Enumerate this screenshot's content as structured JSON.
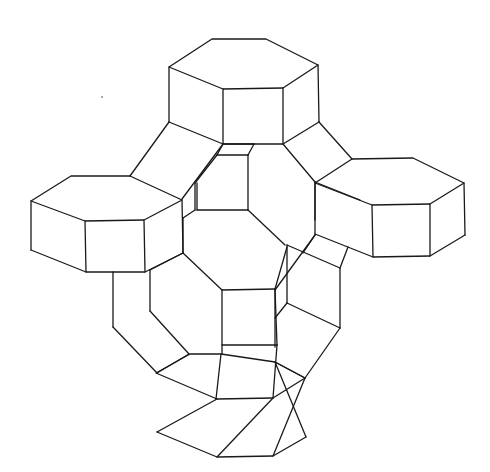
{
  "diagram": {
    "type": "line-drawing",
    "stroke_color": "#1a1a1a",
    "background": "#ffffff",
    "prisms": [
      {
        "name": "top-hexagonal-prism",
        "top": [
          [
            212,
            39
          ],
          [
            266,
            39
          ],
          [
            318,
            65
          ],
          [
            283,
            88
          ],
          [
            223,
            89
          ],
          [
            169,
            67
          ]
        ],
        "bottom_visible": [
          [
            169,
            122
          ],
          [
            223,
            144
          ],
          [
            283,
            144
          ],
          [
            319,
            122
          ]
        ]
      },
      {
        "name": "left-hexagonal-prism",
        "top": [
          [
            71,
            176
          ],
          [
            130,
            176
          ],
          [
            182,
            200
          ],
          [
            144,
            220
          ],
          [
            85,
            221
          ],
          [
            31,
            201
          ]
        ],
        "bottom_visible": [
          [
            31,
            250
          ],
          [
            86,
            272
          ],
          [
            145,
            272
          ],
          [
            183,
            253
          ]
        ]
      },
      {
        "name": "right-hexagonal-prism",
        "top": [
          [
            352,
            159
          ],
          [
            413,
            158
          ],
          [
            464,
            183
          ],
          [
            430,
            204
          ],
          [
            372,
            205
          ],
          [
            315,
            183
          ]
        ],
        "bottom_visible": [
          [
            315,
            234
          ],
          [
            373,
            257
          ],
          [
            430,
            256
          ],
          [
            465,
            235
          ]
        ]
      },
      {
        "name": "bottom-hexagonal-prism",
        "top": [
          [
            156,
            373
          ],
          [
            190,
            354
          ],
          [
            221,
            354
          ],
          [
            275,
            362
          ],
          [
            305,
            378
          ],
          [
            273,
            398
          ],
          [
            217,
            399
          ]
        ],
        "bottom_visible": [
          [
            157,
            432
          ],
          [
            217,
            457
          ],
          [
            273,
            456
          ],
          [
            306,
            437
          ]
        ]
      }
    ],
    "edges": [
      [
        [
          169,
          122
        ],
        [
          130,
          176
        ]
      ],
      [
        [
          223,
          144
        ],
        [
          182,
          199
        ]
      ],
      [
        [
          283,
          144
        ],
        [
          315,
          182
        ]
      ],
      [
        [
          319,
          122
        ],
        [
          352,
          159
        ]
      ],
      [
        [
          223,
          144
        ],
        [
          254,
          144
        ]
      ],
      [
        [
          254,
          144
        ],
        [
          248,
          155
        ]
      ],
      [
        [
          248,
          155
        ],
        [
          217,
          155
        ]
      ],
      [
        [
          217,
          155
        ],
        [
          223,
          144
        ]
      ],
      [
        [
          217,
          155
        ],
        [
          195,
          183
        ]
      ],
      [
        [
          195,
          183
        ],
        [
          195,
          210
        ]
      ],
      [
        [
          195,
          210
        ],
        [
          183,
          218
        ]
      ],
      [
        [
          197,
          183
        ],
        [
          197,
          210
        ]
      ],
      [
        [
          248,
          155
        ],
        [
          248,
          210
        ]
      ],
      [
        [
          197,
          210
        ],
        [
          248,
          210
        ]
      ],
      [
        [
          248,
          210
        ],
        [
          285,
          245
        ]
      ],
      [
        [
          315,
          182
        ],
        [
          315,
          220
        ]
      ],
      [
        [
          315,
          182
        ],
        [
          360,
          200
        ]
      ],
      [
        [
          183,
          253
        ],
        [
          150,
          270
        ]
      ],
      [
        [
          150,
          270
        ],
        [
          150,
          311
        ]
      ],
      [
        [
          113,
          272
        ],
        [
          113,
          327
        ]
      ],
      [
        [
          183,
          218
        ],
        [
          183,
          253
        ]
      ],
      [
        [
          183,
          253
        ],
        [
          222,
          290
        ]
      ],
      [
        [
          222,
          290
        ],
        [
          275,
          289
        ]
      ],
      [
        [
          275,
          289
        ],
        [
          287,
          247
        ]
      ],
      [
        [
          222,
          290
        ],
        [
          222,
          354
        ]
      ],
      [
        [
          275,
          289
        ],
        [
          277,
          345
        ]
      ],
      [
        [
          222,
          345
        ],
        [
          277,
          345
        ]
      ],
      [
        [
          287,
          245
        ],
        [
          287,
          303
        ]
      ],
      [
        [
          287,
          245
        ],
        [
          340,
          268
        ]
      ],
      [
        [
          315,
          235
        ],
        [
          275,
          290
        ]
      ],
      [
        [
          315,
          235
        ],
        [
          303,
          253
        ]
      ],
      [
        [
          348,
          247
        ],
        [
          340,
          268
        ]
      ],
      [
        [
          340,
          268
        ],
        [
          340,
          328
        ]
      ],
      [
        [
          287,
          303
        ],
        [
          340,
          328
        ]
      ],
      [
        [
          287,
          303
        ],
        [
          275,
          318
        ]
      ],
      [
        [
          340,
          328
        ],
        [
          305,
          378
        ]
      ],
      [
        [
          275,
          289
        ],
        [
          275,
          347
        ]
      ],
      [
        [
          113,
          327
        ],
        [
          157,
          373
        ]
      ],
      [
        [
          150,
          311
        ],
        [
          189,
          354
        ]
      ],
      [
        [
          189,
          354
        ],
        [
          157,
          373
        ]
      ],
      [
        [
          221,
          354
        ],
        [
          216,
          399
        ]
      ],
      [
        [
          277,
          345
        ],
        [
          273,
          398
        ]
      ],
      [
        [
          275,
          362
        ],
        [
          305,
          378
        ]
      ]
    ],
    "specks": [
      [
        102,
        97
      ]
    ]
  }
}
